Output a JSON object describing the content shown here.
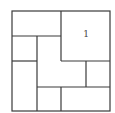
{
  "diagram": {
    "type": "square-dissection",
    "stroke_color": "#3a3a3a",
    "background": "#ffffff",
    "outer": {
      "x": 12,
      "y": 11,
      "w": 98,
      "h": 100
    },
    "lines": [
      {
        "x1": 12,
        "y1": 36,
        "x2": 61,
        "y2": 36
      },
      {
        "x1": 61,
        "y1": 11,
        "x2": 61,
        "y2": 61
      },
      {
        "x1": 61,
        "y1": 61,
        "x2": 110,
        "y2": 61
      },
      {
        "x1": 37,
        "y1": 36,
        "x2": 37,
        "y2": 111
      },
      {
        "x1": 12,
        "y1": 61,
        "x2": 37,
        "y2": 61
      },
      {
        "x1": 86,
        "y1": 61,
        "x2": 86,
        "y2": 87
      },
      {
        "x1": 37,
        "y1": 87,
        "x2": 110,
        "y2": 87
      },
      {
        "x1": 61,
        "y1": 87,
        "x2": 61,
        "y2": 111
      }
    ],
    "labels": [
      {
        "text": "1",
        "x": 86,
        "y": 37
      }
    ]
  }
}
